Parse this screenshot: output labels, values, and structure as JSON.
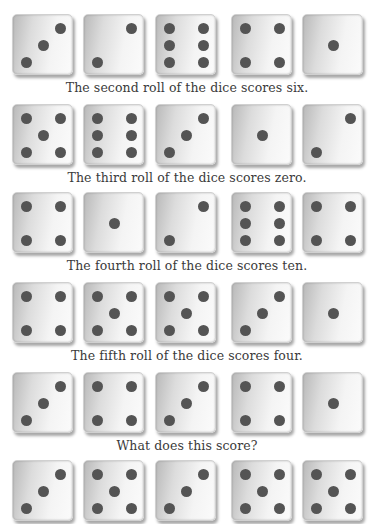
{
  "rows": [
    {
      "dice": [
        3,
        2,
        6,
        4,
        1
      ],
      "caption": "The second roll of the dice scores six."
    },
    {
      "dice": [
        5,
        6,
        3,
        1,
        2
      ],
      "caption": "The third roll of the dice scores zero."
    },
    {
      "dice": [
        4,
        1,
        2,
        6,
        4
      ],
      "caption": "The fourth roll of the dice scores ten."
    },
    {
      "dice": [
        4,
        5,
        5,
        3,
        1
      ],
      "caption": "The fifth roll of the dice scores four."
    },
    {
      "dice": [
        3,
        4,
        3,
        4,
        1
      ],
      "caption": "What does this score?"
    },
    {
      "dice": [
        3,
        5,
        3,
        5,
        5
      ],
      "caption": ""
    }
  ],
  "colors": {
    "pip": "#545454",
    "caption": "#3a3a3a",
    "background": "#ffffff"
  }
}
